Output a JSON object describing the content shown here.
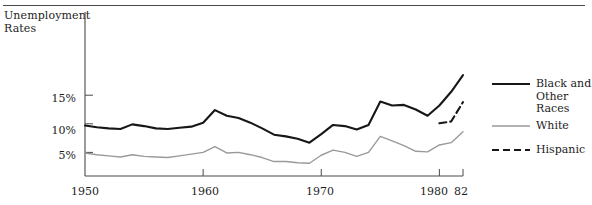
{
  "figure": {
    "name": "unemployment-rates-line-chart",
    "top_rule": true
  },
  "chart_data": {
    "type": "line",
    "title": "Unemployment Rates",
    "xlabel": "",
    "ylabel": "Unemployment Rates",
    "grid": false,
    "legend_position": "right",
    "xlim": [
      1950,
      1982
    ],
    "ylim": [
      0,
      20
    ],
    "xticks": [
      1950,
      1960,
      1970,
      1980,
      1982
    ],
    "xtick_labels": [
      "1950",
      "1960",
      "1970",
      "1980",
      "82"
    ],
    "yticks": [
      5,
      10,
      15
    ],
    "ytick_labels": [
      "5%",
      "10%",
      "15%"
    ],
    "series": [
      {
        "name": "Black and Other Races",
        "style": "solid-thick",
        "color": "#171717",
        "x": [
          1950,
          1951,
          1952,
          1953,
          1954,
          1955,
          1956,
          1957,
          1958,
          1959,
          1960,
          1961,
          1962,
          1963,
          1964,
          1965,
          1966,
          1967,
          1968,
          1969,
          1970,
          1971,
          1972,
          1973,
          1974,
          1975,
          1976,
          1977,
          1978,
          1979,
          1980,
          1981,
          1982
        ],
        "values": [
          9.7,
          9.4,
          9.2,
          9.1,
          9.9,
          9.6,
          9.2,
          9.1,
          9.3,
          9.5,
          10.2,
          12.4,
          11.4,
          11.0,
          10.2,
          9.2,
          8.1,
          7.8,
          7.4,
          6.7,
          8.2,
          9.8,
          9.6,
          9.0,
          9.8,
          13.9,
          13.2,
          13.3,
          12.5,
          11.4,
          13.2,
          15.6,
          18.5
        ]
      },
      {
        "name": "White",
        "style": "solid-thin",
        "color": "#9a9a9a",
        "x": [
          1950,
          1951,
          1952,
          1953,
          1954,
          1955,
          1956,
          1957,
          1958,
          1959,
          1960,
          1961,
          1962,
          1963,
          1964,
          1965,
          1966,
          1967,
          1968,
          1969,
          1970,
          1971,
          1972,
          1973,
          1974,
          1975,
          1976,
          1977,
          1978,
          1979,
          1980,
          1981,
          1982
        ],
        "values": [
          4.9,
          4.6,
          4.4,
          4.2,
          4.6,
          4.3,
          4.2,
          4.1,
          4.4,
          4.7,
          5.0,
          6.0,
          4.9,
          5.0,
          4.6,
          4.1,
          3.4,
          3.4,
          3.2,
          3.1,
          4.5,
          5.4,
          5.0,
          4.3,
          5.0,
          7.8,
          7.0,
          6.2,
          5.2,
          5.1,
          6.3,
          6.7,
          8.6
        ]
      },
      {
        "name": "Hispanic",
        "style": "dashed",
        "color": "#171717",
        "x": [
          1980,
          1981,
          1982
        ],
        "values": [
          10.1,
          10.4,
          13.8
        ]
      }
    ]
  },
  "legend": {
    "items": [
      {
        "label": "Black and Other Races",
        "swatch": "solid-thick"
      },
      {
        "label": "White",
        "swatch": "solid-thin"
      },
      {
        "label": "Hispanic",
        "swatch": "dashed"
      }
    ]
  }
}
